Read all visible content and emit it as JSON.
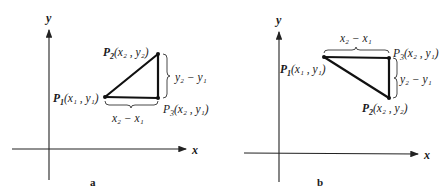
{
  "figure": {
    "panels": [
      {
        "id": "a",
        "caption": "a",
        "axes": {
          "x_label": "x",
          "y_label": "y"
        },
        "points": {
          "p1": {
            "name": "P",
            "sub": "1",
            "coords": "(x₁ , y₁)"
          },
          "p2": {
            "name": "P",
            "sub": "2",
            "coords": "(x₂ , y₂)"
          },
          "p3": {
            "name": "P",
            "sub": "3",
            "coords": "(x₂ , y₁)"
          }
        },
        "measures": {
          "horizontal": "x₂ − x₁",
          "vertical": "y₂ − y₁"
        }
      },
      {
        "id": "b",
        "caption": "b",
        "axes": {
          "x_label": "x",
          "y_label": "y"
        },
        "points": {
          "p1": {
            "name": "P",
            "sub": "1",
            "coords": "(x₁ , y₁)"
          },
          "p2": {
            "name": "P",
            "sub": "2",
            "coords": "(x₂ , y₂)"
          },
          "p3": {
            "name": "P",
            "sub": "3",
            "coords": "(x₂ , y₁)"
          }
        },
        "measures": {
          "horizontal": "x₂ − x₁",
          "vertical": "y₂ − y₁"
        }
      }
    ]
  }
}
